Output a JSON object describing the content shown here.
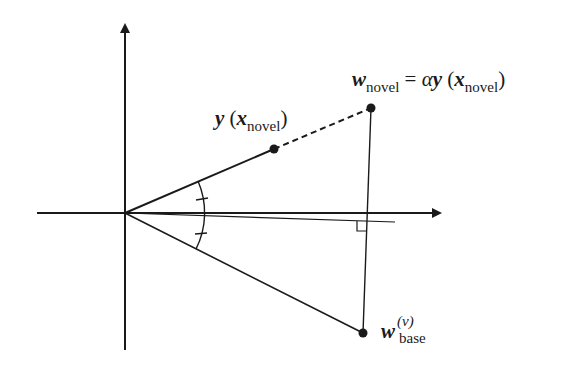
{
  "diagram": {
    "type": "vector-geometry",
    "colors": {
      "stroke": "#1a1a1a",
      "background": "#ffffff"
    },
    "points": {
      "origin": {
        "x": 125,
        "y": 213
      },
      "y_x_novel": {
        "x": 274,
        "y": 149
      },
      "w_novel": {
        "x": 371,
        "y": 108
      },
      "w_base": {
        "x": 363,
        "y": 333
      }
    },
    "labels": {
      "w_novel_eq": {
        "w": "w",
        "w_sub": "novel",
        "eq": " = ",
        "alpha": "α",
        "y": "y",
        "lparen": " (",
        "x": "x",
        "x_sub": "novel",
        "rparen": ")"
      },
      "y_x_novel": {
        "y": "y",
        "lparen": " (",
        "x": "x",
        "x_sub": "novel",
        "rparen": ")"
      },
      "w_base": {
        "w": "w",
        "sup": "(ν)",
        "sub": "base"
      }
    },
    "annotations": [
      "angle-arc-between-y-and-w-base-bisected-by-projection",
      "equal-angle-tick-marks",
      "right-angle-marker-at-projection-foot",
      "dashed-extension-from-y-to-w-novel"
    ]
  }
}
